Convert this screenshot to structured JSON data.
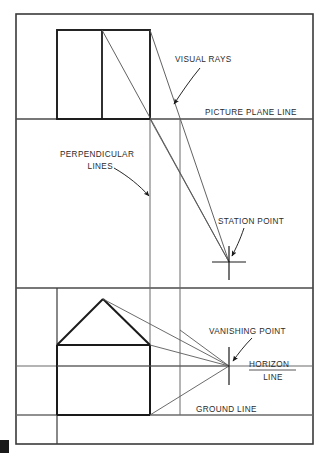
{
  "diagram": {
    "type": "technical-line-drawing",
    "background_color": "#ffffff",
    "line_color_heavy": "#1a1a1a",
    "line_color_light": "#6b6b6b",
    "text_color": "#2b2b2b",
    "labels": {
      "visual_rays": "VISUAL RAYS",
      "picture_plane_line": "PICTURE PLANE LINE",
      "perpendicular_lines_1": "PERPENDICULAR",
      "perpendicular_lines_2": "LINES",
      "station_point": "STATION POINT",
      "vanishing_point": "VANISHING POINT",
      "horizon_line_1": "HORIZON",
      "horizon_line_2": "LINE",
      "ground_line": "GROUND LINE"
    },
    "markers": {
      "station_point": {
        "x": 229,
        "y": 262,
        "glyph": "cross-marker"
      },
      "vanishing_point": {
        "x": 229,
        "y": 366,
        "glyph": "cross-marker"
      }
    },
    "reference_lines": {
      "picture_plane_y": 119,
      "upper_divider_y": 288,
      "horizon_y": 366,
      "ground_y": 415,
      "perpendicular_x_1": 150,
      "perpendicular_x_2": 180
    },
    "plan_view": {
      "name": "plan-rectangle",
      "left": 57,
      "right": 150,
      "top": 30,
      "bottom": 119,
      "divider_x": 102
    },
    "elevation_view": {
      "name": "house-elevation",
      "left": 57,
      "right": 150,
      "wall_top": 345,
      "wall_bottom": 415,
      "apex_x": 103,
      "apex_y": 299
    },
    "frame": {
      "outer_left": 16,
      "outer_top": 14,
      "outer_right": 313,
      "outer_bottom": 444
    }
  }
}
